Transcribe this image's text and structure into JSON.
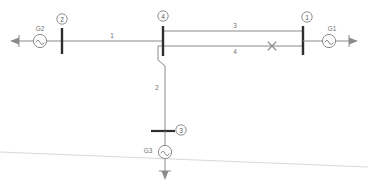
{
  "diagram": {
    "kind": "single-line-diagram",
    "title": "",
    "background_color": "#ffffff",
    "line_color": "#8a8a8a",
    "bus_color": "#2e2e2e",
    "text_color": "#6f6f6f",
    "faint_artifact_color": "#d9d9d9",
    "buses": [
      {
        "id": "bus-2",
        "label": "2",
        "orientation": "vertical",
        "x": 62,
        "y": 41
      },
      {
        "id": "bus-4",
        "label": "4",
        "orientation": "vertical",
        "x": 163,
        "y": 41
      },
      {
        "id": "bus-1",
        "label": "1",
        "orientation": "vertical",
        "x": 303,
        "y": 41
      },
      {
        "id": "bus-3",
        "label": "3",
        "orientation": "horizontal",
        "x": 164,
        "y": 131
      }
    ],
    "generators": [
      {
        "id": "gen-g2",
        "label": "G2",
        "x": 40,
        "y": 41,
        "label_x": 40,
        "label_y": 29
      },
      {
        "id": "gen-g1",
        "label": "G1",
        "x": 329,
        "y": 41,
        "label_x": 331,
        "label_y": 29
      },
      {
        "id": "gen-g3",
        "label": "G3",
        "x": 165,
        "y": 152,
        "label_x": 148,
        "label_y": 150
      }
    ],
    "branches": [
      {
        "id": "branch-1",
        "label": "1",
        "from": "bus-2",
        "to": "bus-4",
        "label_x": 112,
        "label_y": 36
      },
      {
        "id": "branch-2",
        "label": "2",
        "from": "bus-4",
        "to": "bus-3",
        "label_x": 157,
        "label_y": 88
      },
      {
        "id": "branch-3",
        "label": "3",
        "from": "bus-4",
        "to": "bus-1",
        "label_x": 235,
        "label_y": 35
      },
      {
        "id": "branch-4",
        "label": "4",
        "from": "bus-4",
        "to": "bus-1",
        "label_x": 235,
        "label_y": 52
      }
    ],
    "fault": {
      "id": "fault-marker",
      "symbol": "x",
      "on_branch": "branch-4",
      "x": 272,
      "y": 46
    },
    "terminals": [
      {
        "id": "terminal-left",
        "direction": "left",
        "x": 14,
        "y": 41
      },
      {
        "id": "terminal-right",
        "direction": "right",
        "x": 354,
        "y": 41
      },
      {
        "id": "terminal-down",
        "direction": "down",
        "x": 165,
        "y": 177
      }
    ],
    "scan_artifact": {
      "description": "faint diagonal scan line",
      "x1": 0,
      "y1": 152,
      "x2": 368,
      "y2": 167
    }
  }
}
